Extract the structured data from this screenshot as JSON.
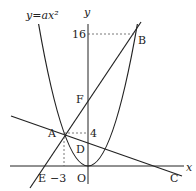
{
  "figure": {
    "curve_label": "y=ax²",
    "axis_labels": {
      "x": "x",
      "y": "y"
    },
    "points": {
      "A": {
        "label": "A",
        "coords": [
          -3,
          4
        ]
      },
      "B": {
        "label": "B",
        "coords": [
          6,
          16
        ]
      },
      "C": {
        "label": "C"
      },
      "D": {
        "label": "D"
      },
      "E": {
        "label": "E"
      },
      "F": {
        "label": "F"
      },
      "O": {
        "label": "O"
      }
    },
    "tick_labels": {
      "y16": "16",
      "y4": "4",
      "xm3": "−3"
    },
    "colors": {
      "line": "#222222",
      "dashed": "#555555"
    }
  }
}
